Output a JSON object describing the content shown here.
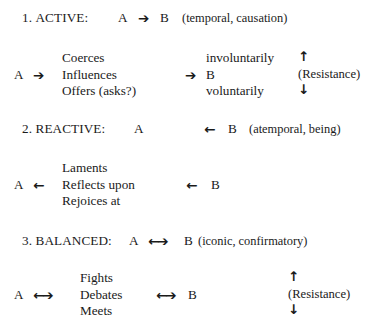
{
  "figure": {
    "background_color": "#ffffff",
    "text_color": "#1a1a1a"
  },
  "glyphs": {
    "right_arrow": "➔",
    "left_arrow": "←",
    "up_arrow": "↑",
    "down_arrow": "↓",
    "bidirectional_left": "←",
    "bidirectional_right": "➔"
  },
  "sections": [
    {
      "id": "active",
      "number": "1.",
      "name": "ACTIVE:",
      "heading": {
        "subject": "A",
        "arrow": "➔",
        "object": "B",
        "note": "(temporal, causation)"
      },
      "detail": {
        "subject": "A",
        "subject_arrow": "➔",
        "verbs": [
          "Coerces",
          "Influences",
          "Offers (asks?)"
        ],
        "mid_arrow": "➔",
        "objects": [
          "involuntarily",
          "B",
          "voluntarily"
        ],
        "resistance": {
          "up": "↑",
          "label": "(Resistance)",
          "down": "↓"
        }
      }
    },
    {
      "id": "reactive",
      "number": "2.",
      "name": "REACTIVE:",
      "heading": {
        "subject": "A",
        "arrow": "←",
        "object": "B",
        "note": "(atemporal, being)"
      },
      "detail": {
        "subject": "A",
        "subject_arrow": "←",
        "verbs": [
          "Laments",
          "Reflects upon",
          "Rejoices at"
        ],
        "mid_arrow": "←",
        "objects": [
          "",
          "B",
          ""
        ],
        "resistance": null
      }
    },
    {
      "id": "balanced",
      "number": "3.",
      "name": "BALANCED:",
      "heading": {
        "subject": "A",
        "arrow": "←➔",
        "object": "B",
        "note": "(iconic, confirmatory)"
      },
      "detail": {
        "subject": "A",
        "subject_arrow": "←➔",
        "verbs": [
          "Fights",
          "Debates",
          "Meets"
        ],
        "mid_arrow": "←➔",
        "objects": [
          "",
          "B",
          ""
        ],
        "resistance": {
          "up": "↑",
          "label": "(Resistance)",
          "down": "↓"
        }
      }
    }
  ]
}
